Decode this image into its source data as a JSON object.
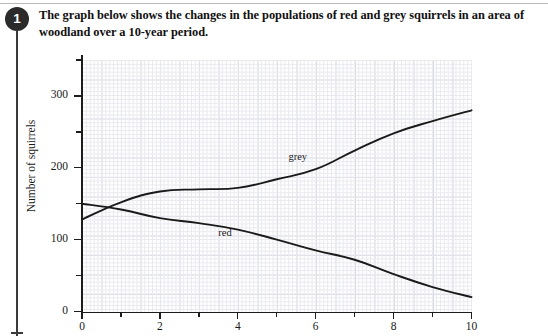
{
  "question": {
    "number": "1",
    "text": "The graph below shows the changes in the populations of red and grey squirrels in an area of woodland over a 10-year period."
  },
  "chart_data": {
    "type": "line",
    "title": "",
    "xlabel": "",
    "ylabel": "Number of squirrels",
    "xlim": [
      0,
      10
    ],
    "ylim": [
      0,
      350
    ],
    "grid": true,
    "legend_position": "inline-labels",
    "x_ticks": [
      "0",
      "2",
      "4",
      "6",
      "8",
      "10"
    ],
    "x_tick_values": [
      0,
      2,
      4,
      6,
      8,
      10
    ],
    "y_ticks": [
      "0",
      "100",
      "200",
      "300"
    ],
    "y_tick_values": [
      0,
      100,
      200,
      300
    ],
    "y_minor_tick_values": [
      50,
      150,
      250,
      350
    ],
    "x": [
      0,
      1,
      2,
      3,
      4,
      5,
      6,
      7,
      8,
      9,
      10
    ],
    "series": [
      {
        "name": "grey",
        "label": "grey",
        "color": "#1a1a1a",
        "values": [
          128,
          152,
          167,
          170,
          172,
          184,
          198,
          224,
          248,
          265,
          280
        ]
      },
      {
        "name": "red",
        "label": "red",
        "color": "#1a1a1a",
        "values": [
          150,
          142,
          130,
          123,
          114,
          100,
          85,
          72,
          52,
          34,
          20
        ]
      }
    ],
    "annotations": [
      {
        "text": "grey",
        "x": 5.3,
        "y": 213
      },
      {
        "text": "red",
        "x": 3.5,
        "y": 108
      }
    ]
  }
}
